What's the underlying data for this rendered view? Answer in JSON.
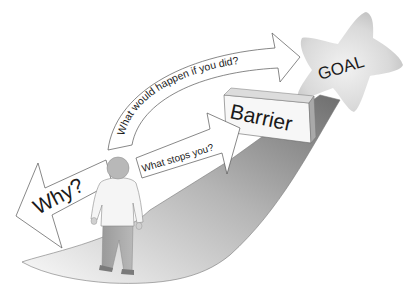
{
  "diagram": {
    "type": "conceptual-goal-path",
    "nodes": {
      "goal": {
        "label": "GOAL",
        "shape": "star"
      },
      "barrier": {
        "label": "Barrier",
        "shape": "3d-block"
      },
      "person": {
        "label": "",
        "shape": "person-figure"
      }
    },
    "arrows": [
      {
        "id": "why",
        "label": "Why?",
        "direction": "backward",
        "from": "person",
        "to": "back"
      },
      {
        "id": "what-stops",
        "label": "What stops you?",
        "direction": "forward",
        "from": "person",
        "to": "barrier"
      },
      {
        "id": "what-would-happen",
        "label": "What would happen if you did?",
        "direction": "forward-curved",
        "from": "person",
        "to": "goal"
      }
    ],
    "path": {
      "description": "shaded road from person to goal"
    },
    "caption": ""
  },
  "colors": {
    "outline": "#555555",
    "arrow_fill": "#ffffff",
    "star_light": "#e6e6e6",
    "star_dark": "#c4c4c4",
    "path_dark": "#8a8a8a",
    "path_light": "#f4f4f4",
    "barrier_face": "#f7f7f7",
    "barrier_side": "#a9a9a9",
    "person_shirt": "#f5f5f5",
    "person_pants": "#a8a8a8",
    "person_head": "#b8b8b8"
  }
}
